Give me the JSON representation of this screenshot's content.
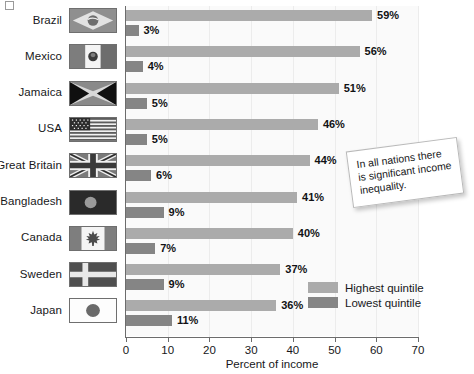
{
  "chart_data": {
    "type": "bar",
    "orientation": "horizontal",
    "title": "",
    "xlabel": "Percent of income",
    "ylabel": "",
    "xlim": [
      0,
      70
    ],
    "xticks": [
      0,
      10,
      20,
      30,
      40,
      50,
      60,
      70
    ],
    "grid": true,
    "legend_position": "inside-bottom-right",
    "categories": [
      "Brazil",
      "Mexico",
      "Jamaica",
      "USA",
      "Great Britain",
      "Bangladesh",
      "Canada",
      "Sweden",
      "Japan"
    ],
    "series": [
      {
        "name": "Highest quintile",
        "color": "#ababab",
        "values": [
          59,
          56,
          51,
          46,
          44,
          41,
          40,
          37,
          36
        ],
        "labels": [
          "59%",
          "56%",
          "51%",
          "46%",
          "44%",
          "41%",
          "40%",
          "37%",
          "36%"
        ]
      },
      {
        "name": "Lowest quintile",
        "color": "#858585",
        "values": [
          3,
          4,
          5,
          5,
          6,
          9,
          7,
          9,
          11
        ],
        "labels": [
          "3%",
          "4%",
          "5%",
          "5%",
          "6%",
          "9%",
          "7%",
          "9%",
          "11%"
        ]
      }
    ],
    "annotations": [
      {
        "text": "In all nations there is significant income inequality."
      }
    ],
    "flags": [
      {
        "country": "Brazil",
        "icon": "flag-brazil-icon"
      },
      {
        "country": "Mexico",
        "icon": "flag-mexico-icon"
      },
      {
        "country": "Jamaica",
        "icon": "flag-jamaica-icon"
      },
      {
        "country": "USA",
        "icon": "flag-usa-icon"
      },
      {
        "country": "Great Britain",
        "icon": "flag-great-britain-icon"
      },
      {
        "country": "Bangladesh",
        "icon": "flag-bangladesh-icon"
      },
      {
        "country": "Canada",
        "icon": "flag-canada-icon"
      },
      {
        "country": "Sweden",
        "icon": "flag-sweden-icon"
      },
      {
        "country": "Japan",
        "icon": "flag-japan-icon"
      }
    ]
  },
  "axis": {
    "xlabel": "Percent of income",
    "tick_labels": [
      "0",
      "10",
      "20",
      "30",
      "40",
      "50",
      "60",
      "70"
    ]
  },
  "legend": {
    "items": [
      {
        "label": "Highest quintile",
        "color": "#ababab"
      },
      {
        "label": "Lowest quintile",
        "color": "#858585"
      }
    ]
  },
  "annotation": {
    "text": "In all nations there is significant income inequality."
  },
  "colors": {
    "highest_quintile": "#ababab",
    "lowest_quintile": "#858585",
    "plot_background": "#fafafa",
    "axis": "#6c6c6c",
    "text": "#17181a"
  }
}
